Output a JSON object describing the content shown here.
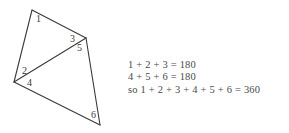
{
  "figure": {
    "name": "quadrilateral-angle-sum-diagram",
    "line_color": "#3a3a3a",
    "background_color": "#ffffff",
    "text_color": "#4a4a4a"
  },
  "diagram": {
    "vertices": {
      "top": {
        "x": 32,
        "y": 10
      },
      "right": {
        "x": 86,
        "y": 38
      },
      "left": {
        "x": 14,
        "y": 82
      },
      "bottom": {
        "x": 100,
        "y": 125
      }
    },
    "edges": [
      {
        "name": "edge-top-right",
        "from": "top",
        "to": "right"
      },
      {
        "name": "edge-top-left",
        "from": "top",
        "to": "left"
      },
      {
        "name": "edge-right-bottom",
        "from": "right",
        "to": "bottom"
      },
      {
        "name": "edge-left-bottom",
        "from": "left",
        "to": "bottom"
      },
      {
        "name": "diagonal-left-right",
        "from": "left",
        "to": "right"
      }
    ],
    "angle_labels": [
      {
        "id": "1",
        "text": "1",
        "x": 36,
        "y": 22
      },
      {
        "id": "2",
        "text": "2",
        "x": 22,
        "y": 74
      },
      {
        "id": "3",
        "text": "3",
        "x": 70,
        "y": 42
      },
      {
        "id": "4",
        "text": "4",
        "x": 27,
        "y": 86
      },
      {
        "id": "5",
        "text": "5",
        "x": 77,
        "y": 51
      },
      {
        "id": "6",
        "text": "6",
        "x": 91,
        "y": 118
      }
    ]
  },
  "proof": {
    "lines": [
      "1 + 2 + 3 = 180",
      "4 + 5 + 6 = 180",
      "so 1 + 2 + 3 + 4 + 5 + 6 = 360"
    ]
  }
}
